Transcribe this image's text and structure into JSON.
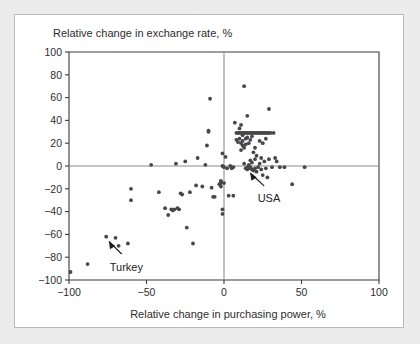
{
  "figure": {
    "background_color": "#ececed",
    "card_color": "#ffffff",
    "border_color": "#b9babb"
  },
  "chart_data": {
    "type": "scatter",
    "title": "",
    "xlabel": "Relative change in purchasing power, %",
    "ylabel": "Relative change in exchange rate, %",
    "xlim": [
      -100,
      100
    ],
    "ylim": [
      -100,
      100
    ],
    "xticks": [
      -100,
      -50,
      0,
      50,
      100
    ],
    "yticks": [
      -100,
      -80,
      -60,
      -40,
      -20,
      0,
      20,
      40,
      60,
      80,
      100
    ],
    "xticklabels": [
      "-100",
      "-50",
      "0",
      "50",
      "100"
    ],
    "yticklabels": [
      "-100",
      "-80",
      "-60",
      "-40",
      "-20",
      "0",
      "20",
      "40",
      "60",
      "80",
      "100"
    ],
    "grid": false,
    "legend": null,
    "zero_lines": {
      "x": 0,
      "y": 0,
      "color": "#8d8e90"
    },
    "marker": {
      "shape": "dot",
      "color": "#474749",
      "size": 1.9
    },
    "series": [
      {
        "name": "countries",
        "points": [
          [
            -99,
            -93
          ],
          [
            -88,
            -86
          ],
          [
            -76,
            -62
          ],
          [
            -70,
            -63
          ],
          [
            -68,
            -70
          ],
          [
            -62,
            -68
          ],
          [
            -60,
            -20
          ],
          [
            -60,
            -30
          ],
          [
            -47,
            1
          ],
          [
            -42,
            -23
          ],
          [
            -38,
            -37
          ],
          [
            -36,
            -43
          ],
          [
            -34,
            -38
          ],
          [
            -33,
            -39
          ],
          [
            -32,
            -38
          ],
          [
            -31,
            2
          ],
          [
            -30,
            -37
          ],
          [
            -29,
            -38
          ],
          [
            -28,
            -24
          ],
          [
            -27,
            -25
          ],
          [
            -25,
            4
          ],
          [
            -24,
            -54
          ],
          [
            -22,
            -23
          ],
          [
            -20,
            -68
          ],
          [
            -18,
            -17
          ],
          [
            -17,
            7
          ],
          [
            -14,
            -18
          ],
          [
            -12,
            1
          ],
          [
            -11,
            18
          ],
          [
            -10,
            30
          ],
          [
            -10,
            31
          ],
          [
            -9,
            59
          ],
          [
            -8,
            -19
          ],
          [
            -7,
            -27
          ],
          [
            -6,
            -27
          ],
          [
            -3,
            -16
          ],
          [
            -2,
            -18
          ],
          [
            -2,
            -14
          ],
          [
            -2,
            -13
          ],
          [
            -2,
            -15
          ],
          [
            -1,
            -42
          ],
          [
            -1,
            -38
          ],
          [
            -1,
            0
          ],
          [
            -1,
            11
          ],
          [
            0,
            -1
          ],
          [
            0,
            -15
          ],
          [
            1,
            8
          ],
          [
            2,
            -2
          ],
          [
            3,
            -26
          ],
          [
            4,
            0
          ],
          [
            5,
            -2
          ],
          [
            6,
            -1
          ],
          [
            7,
            38
          ],
          [
            8,
            29
          ],
          [
            8,
            23
          ],
          [
            9,
            29
          ],
          [
            9,
            21
          ],
          [
            10,
            29
          ],
          [
            10,
            33
          ],
          [
            10,
            24
          ],
          [
            11,
            29
          ],
          [
            11,
            20
          ],
          [
            11,
            36
          ],
          [
            11,
            14
          ],
          [
            12,
            29
          ],
          [
            12,
            27
          ],
          [
            12,
            22
          ],
          [
            12,
            18
          ],
          [
            13,
            29
          ],
          [
            13,
            16
          ],
          [
            13,
            70
          ],
          [
            13,
            2
          ],
          [
            14,
            29
          ],
          [
            14,
            24
          ],
          [
            14,
            19
          ],
          [
            14,
            -2
          ],
          [
            15,
            29
          ],
          [
            15,
            25
          ],
          [
            15,
            -1
          ],
          [
            15,
            -3
          ],
          [
            15,
            44
          ],
          [
            16,
            29
          ],
          [
            16,
            20
          ],
          [
            16,
            -2
          ],
          [
            16,
            1
          ],
          [
            17,
            29
          ],
          [
            17,
            23
          ],
          [
            17,
            -1
          ],
          [
            17,
            5
          ],
          [
            18,
            29
          ],
          [
            18,
            26
          ],
          [
            18,
            -3
          ],
          [
            18,
            3
          ],
          [
            19,
            29
          ],
          [
            19,
            12
          ],
          [
            19,
            -4
          ],
          [
            20,
            29
          ],
          [
            20,
            16
          ],
          [
            20,
            -2
          ],
          [
            20,
            6
          ],
          [
            21,
            29
          ],
          [
            21,
            -5
          ],
          [
            21,
            9
          ],
          [
            22,
            29
          ],
          [
            22,
            -1
          ],
          [
            23,
            29
          ],
          [
            23,
            22
          ],
          [
            23,
            2
          ],
          [
            24,
            29
          ],
          [
            24,
            -3
          ],
          [
            24,
            7
          ],
          [
            25,
            29
          ],
          [
            25,
            20
          ],
          [
            25,
            -8
          ],
          [
            26,
            29
          ],
          [
            26,
            4
          ],
          [
            27,
            29
          ],
          [
            27,
            24
          ],
          [
            27,
            -2
          ],
          [
            28,
            29
          ],
          [
            28,
            -10
          ],
          [
            29,
            50
          ],
          [
            29,
            29
          ],
          [
            29,
            6
          ],
          [
            30,
            29
          ],
          [
            31,
            -1
          ],
          [
            32,
            29
          ],
          [
            33,
            7
          ],
          [
            34,
            4
          ],
          [
            36,
            -1
          ],
          [
            39,
            -1
          ],
          [
            44,
            -16
          ],
          [
            52,
            -1
          ],
          [
            6,
            -26
          ]
        ]
      }
    ],
    "annotations": [
      {
        "label": "Turkey",
        "target": [
          -76,
          -62
        ],
        "label_pos": [
          -63,
          -92
        ]
      },
      {
        "label": "USA",
        "target": [
          15,
          -2
        ],
        "label_pos": [
          29,
          -32
        ]
      }
    ]
  }
}
